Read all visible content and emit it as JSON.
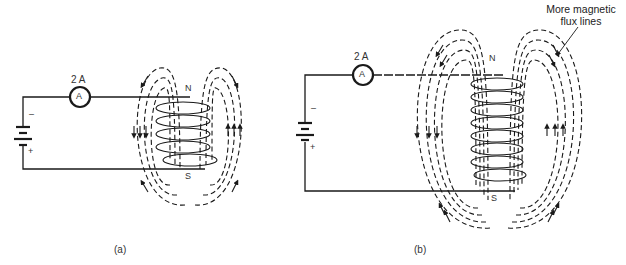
{
  "figure": {
    "panels": [
      {
        "id": "a",
        "caption": "(a)",
        "current_label": "2 A",
        "meter_symbol": "A",
        "battery_minus": "–",
        "battery_plus": "+",
        "pole_north": "N",
        "pole_south": "S",
        "coil_turns": 5,
        "flux_lines_per_side": 3
      },
      {
        "id": "b",
        "caption": "(b)",
        "current_label": "2 A",
        "meter_symbol": "A",
        "battery_minus": "–",
        "battery_plus": "+",
        "pole_north": "N",
        "pole_south": "S",
        "coil_turns": 8,
        "flux_lines_per_side": 4
      }
    ],
    "annotation": {
      "line1": "More magnetic",
      "line2": "flux lines"
    },
    "colors": {
      "ink": "#1a1a1a",
      "background": "#ffffff"
    }
  }
}
